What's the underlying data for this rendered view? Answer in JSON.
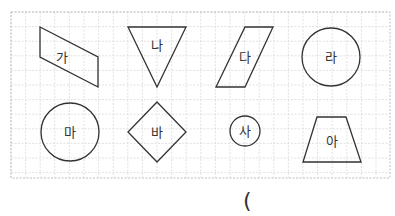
{
  "grid": {
    "x": 11,
    "y": 12,
    "width": 379,
    "height": 166,
    "cell": 14.6,
    "line_color": "#d9d9d9",
    "border_color": "#bfbfbf"
  },
  "shapes": [
    {
      "label": "가",
      "type": "parallelogram",
      "points": "40,27 98,57 98,87 40,57",
      "label_x": 62,
      "label_y": 62
    },
    {
      "label": "나",
      "type": "triangle",
      "points": "128,27 186,27 157,87",
      "label_x": 157,
      "label_y": 50
    },
    {
      "label": "다",
      "type": "parallelogram",
      "points": "245,27 273,27 245,87 216,87",
      "label_x": 245,
      "label_y": 62
    },
    {
      "label": "라",
      "type": "circle",
      "cx": 331,
      "cy": 57,
      "r": 29,
      "label_x": 331,
      "label_y": 62
    },
    {
      "label": "마",
      "type": "circle",
      "cx": 70,
      "cy": 132,
      "r": 29,
      "label_x": 70,
      "label_y": 137
    },
    {
      "label": "바",
      "type": "diamond",
      "points": "157,102 186,132 157,162 128,132",
      "label_x": 157,
      "label_y": 137
    },
    {
      "label": "사",
      "type": "circle",
      "cx": 245,
      "cy": 131,
      "r": 15,
      "label_x": 245,
      "label_y": 136
    },
    {
      "label": "아",
      "type": "trapezoid",
      "points": "317,117 346,117 361,162 303,162",
      "label_x": 332,
      "label_y": 146
    }
  ],
  "answer_area": {
    "text": "("
  },
  "stroke_color": "#333333"
}
